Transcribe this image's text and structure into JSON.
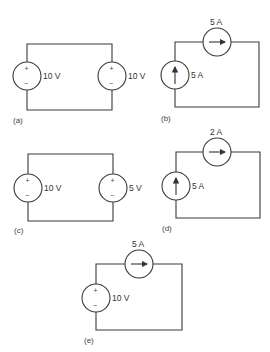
{
  "figure": {
    "circuits": [
      {
        "id": "a",
        "label": "(a)",
        "sources": [
          {
            "type": "voltage",
            "value": "10 V",
            "position": "left",
            "polarity": "+ top"
          },
          {
            "type": "voltage",
            "value": "10 V",
            "position": "right",
            "polarity": "+ top"
          }
        ]
      },
      {
        "id": "b",
        "label": "(b)",
        "sources": [
          {
            "type": "current",
            "value": "5 A",
            "position": "top",
            "direction": "right"
          },
          {
            "type": "current",
            "value": "5 A",
            "position": "left",
            "direction": "up"
          }
        ]
      },
      {
        "id": "c",
        "label": "(c)",
        "sources": [
          {
            "type": "voltage",
            "value": "10 V",
            "position": "left",
            "polarity": "+ top"
          },
          {
            "type": "voltage",
            "value": "5 V",
            "position": "right",
            "polarity": "+ top"
          }
        ]
      },
      {
        "id": "d",
        "label": "(d)",
        "sources": [
          {
            "type": "current",
            "value": "2 A",
            "position": "top",
            "direction": "right"
          },
          {
            "type": "current",
            "value": "5 A",
            "position": "left",
            "direction": "up"
          }
        ]
      },
      {
        "id": "e",
        "label": "(e)",
        "sources": [
          {
            "type": "current",
            "value": "5 A",
            "position": "top",
            "direction": "right"
          },
          {
            "type": "voltage",
            "value": "10 V",
            "position": "left",
            "polarity": "+ top"
          }
        ]
      }
    ],
    "symbols": {
      "plus": "+",
      "minus": "−"
    }
  }
}
